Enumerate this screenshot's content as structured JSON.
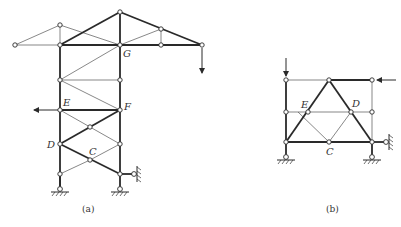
{
  "figure_a": {
    "caption": "(a)",
    "labels": {
      "G": "G",
      "E": "E",
      "F": "F",
      "D": "D",
      "C": "C"
    }
  },
  "figure_b": {
    "caption": "(b)",
    "labels": {
      "E": "E",
      "D": "D",
      "C": "C"
    }
  }
}
